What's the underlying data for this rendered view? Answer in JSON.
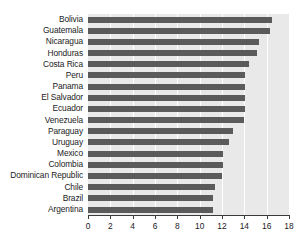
{
  "chart_data": {
    "type": "bar",
    "orientation": "horizontal",
    "title": "",
    "xlabel": "",
    "ylabel": "",
    "xlim": [
      0,
      18
    ],
    "ylim": null,
    "grid": true,
    "legend": null,
    "xticks": [
      0,
      2,
      4,
      6,
      8,
      10,
      12,
      14,
      16,
      18
    ],
    "xtick_labels": [
      "0",
      "2",
      "4",
      "6",
      "8",
      "10",
      "12",
      "14",
      "16",
      "18"
    ],
    "categories": [
      "Bolivia",
      "Guatemala",
      "Nicaragua",
      "Honduras",
      "Costa Rica",
      "Peru",
      "Panama",
      "El Salvador",
      "Ecuador",
      "Venezuela",
      "Paraguay",
      "Uruguay",
      "Mexico",
      "Colombia",
      "Dominican Republic",
      "Chile",
      "Brazil",
      "Argentina"
    ],
    "values": [
      16.5,
      16.3,
      15.3,
      15.1,
      14.4,
      14.1,
      14.1,
      14.1,
      14.1,
      14.0,
      13.0,
      12.6,
      12.1,
      12.1,
      12.0,
      11.4,
      11.2,
      11.2
    ],
    "colors": {
      "bar": "#5b5b5b",
      "plot_background": "#e9e9e9",
      "gridline": "#ffffff",
      "axis": "#3a3a3a",
      "text": "#1b1b1b",
      "figure_background": "#ffffff"
    }
  }
}
